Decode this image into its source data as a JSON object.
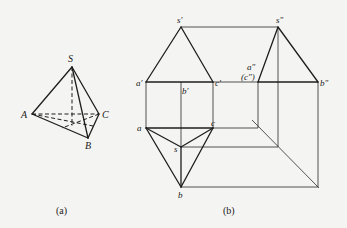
{
  "figure_a": {
    "caption": "(a)",
    "labels": {
      "S": "S",
      "A": "A",
      "B": "B",
      "C": "C"
    }
  },
  "figure_b": {
    "caption": "(b)",
    "front_view_labels": {
      "s1": "s′",
      "a1": "a′",
      "b1": "b′",
      "c1": "c′"
    },
    "side_view_labels": {
      "s2": "s″",
      "a2": "a″",
      "c2": "(c″)",
      "b2": "b″"
    },
    "top_view_labels": {
      "s": "s",
      "a": "a",
      "b": "b",
      "c": "c"
    }
  },
  "colors": {
    "background": "#f4f4f2",
    "line": "#1e1e1e"
  }
}
